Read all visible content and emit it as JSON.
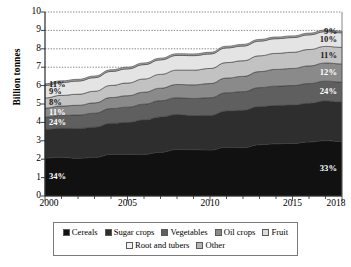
{
  "chart_data": {
    "type": "area",
    "title": "",
    "subtitle": "",
    "xlabel": "",
    "ylabel": "Billion tonnes",
    "stacked": true,
    "grid": true,
    "grid_style": "dotted",
    "legend_position": "bottom",
    "xlim": [
      2000,
      2018
    ],
    "ylim": [
      0,
      10
    ],
    "ytick_labels": [
      "10",
      "9",
      "8",
      "7",
      "6",
      "5",
      "4",
      "3",
      "2",
      "1",
      "0"
    ],
    "ytick_values": [
      10,
      9,
      8,
      7,
      6,
      5,
      4,
      3,
      2,
      1,
      0
    ],
    "xtick_labels": [
      "2000",
      "2005",
      "2010",
      "2015",
      "2018"
    ],
    "xtick_values": [
      2000,
      2005,
      2010,
      2015,
      2018
    ],
    "x": [
      2000,
      2001,
      2002,
      2003,
      2004,
      2005,
      2006,
      2007,
      2008,
      2009,
      2010,
      2011,
      2012,
      2013,
      2014,
      2015,
      2016,
      2017,
      2018
    ],
    "series": [
      {
        "name": "Cereals",
        "color": "#111111",
        "values": [
          2.07,
          2.11,
          2.05,
          2.1,
          2.26,
          2.26,
          2.27,
          2.38,
          2.53,
          2.52,
          2.5,
          2.65,
          2.63,
          2.79,
          2.84,
          2.86,
          2.94,
          3.01,
          2.96
        ]
      },
      {
        "name": "Sugar crops",
        "color": "#2e2e2e",
        "values": [
          1.55,
          1.57,
          1.62,
          1.64,
          1.69,
          1.74,
          1.86,
          1.92,
          1.9,
          1.85,
          1.88,
          1.97,
          2.03,
          2.07,
          2.08,
          2.08,
          2.1,
          2.15,
          2.15
        ]
      },
      {
        "name": "Vegetables",
        "color": "#5f5f5f",
        "values": [
          0.67,
          0.7,
          0.73,
          0.76,
          0.8,
          0.83,
          0.86,
          0.88,
          0.91,
          0.93,
          0.96,
          0.99,
          1.01,
          1.03,
          1.05,
          1.06,
          1.07,
          1.08,
          1.08
        ]
      },
      {
        "name": "Oil crops",
        "color": "#8a8a8a",
        "values": [
          0.49,
          0.51,
          0.53,
          0.56,
          0.6,
          0.62,
          0.65,
          0.68,
          0.72,
          0.74,
          0.77,
          0.8,
          0.83,
          0.87,
          0.91,
          0.93,
          0.96,
          0.99,
          0.99
        ]
      },
      {
        "name": "Fruit",
        "color": "#c2c2c2",
        "values": [
          0.55,
          0.58,
          0.6,
          0.63,
          0.66,
          0.69,
          0.72,
          0.75,
          0.78,
          0.8,
          0.82,
          0.84,
          0.85,
          0.86,
          0.87,
          0.88,
          0.89,
          0.9,
          0.9
        ]
      },
      {
        "name": "Root and tubers",
        "color": "#e4e4e4",
        "values": [
          0.68,
          0.7,
          0.72,
          0.74,
          0.76,
          0.77,
          0.78,
          0.79,
          0.8,
          0.79,
          0.79,
          0.8,
          0.8,
          0.8,
          0.8,
          0.8,
          0.8,
          0.8,
          0.79
        ]
      },
      {
        "name": "Other",
        "color": "#a8a8a8",
        "values": [
          0.09,
          0.09,
          0.09,
          0.09,
          0.09,
          0.09,
          0.09,
          0.09,
          0.09,
          0.09,
          0.09,
          0.09,
          0.09,
          0.09,
          0.09,
          0.09,
          0.09,
          0.09,
          0.09
        ]
      }
    ],
    "totals": [
      6.1,
      6.26,
      6.34,
      6.52,
      6.86,
      7.0,
      7.23,
      7.49,
      7.73,
      7.72,
      7.81,
      8.14,
      8.24,
      8.51,
      8.64,
      8.7,
      8.85,
      9.02,
      8.96
    ],
    "annotations": {
      "left": [
        {
          "series": "Other",
          "text": "11%",
          "value": 11
        },
        {
          "series": "Root and tubers",
          "text": "9%",
          "value": 9
        },
        {
          "series": "Fruit",
          "text": "8%",
          "value": 8
        },
        {
          "series": "Oil crops",
          "text": "11%",
          "value": 11
        },
        {
          "series": "Vegetables",
          "text": "24%",
          "value": 24
        },
        {
          "series": "Cereals",
          "text": "34%",
          "value": 34
        }
      ],
      "right": [
        {
          "series": "Other",
          "text": "9%",
          "value": 9
        },
        {
          "series": "Root and tubers",
          "text": "10%",
          "value": 10
        },
        {
          "series": "Fruit",
          "text": "11%",
          "value": 11
        },
        {
          "series": "Oil crops",
          "text": "12%",
          "value": 12
        },
        {
          "series": "Vegetables",
          "text": "24%",
          "value": 24
        },
        {
          "series": "Cereals",
          "text": "33%",
          "value": 33
        }
      ]
    },
    "legend": {
      "row1": [
        {
          "label": "Cereals",
          "color": "#111111"
        },
        {
          "label": "Sugar crops",
          "color": "#2e2e2e"
        },
        {
          "label": "Vegetables",
          "color": "#5f5f5f"
        },
        {
          "label": "Oil crops",
          "color": "#8a8a8a"
        },
        {
          "label": "Fruit",
          "color": "#dcdcdc"
        }
      ],
      "row2": [
        {
          "label": "Root and tubers",
          "color": "#f2f2f2"
        },
        {
          "label": "Other",
          "color": "#b5b5b5"
        }
      ]
    }
  }
}
